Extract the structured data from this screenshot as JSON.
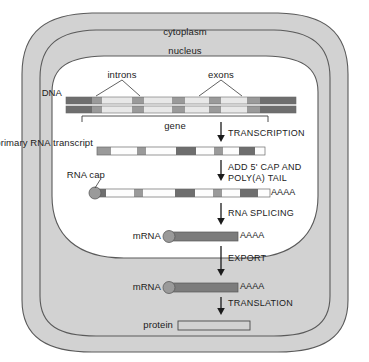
{
  "figure": {
    "compartments": {
      "cytoplasm_label": "cytoplasm",
      "nucleus_label": "nucleus"
    },
    "colors": {
      "cytoplasm_fill": "#d2d2d2",
      "nucleus_fill": "#ffffff",
      "outline": "#5a5a5a",
      "segment_dark": "#6e6e6e",
      "segment_mid": "#9a9a9a",
      "segment_light": "#e8e8e8",
      "segment_white": "#fdfdfd",
      "mrna_body": "#7c7c7c",
      "cap_fill": "#9a9a9a",
      "protein_fill": "#d2d2d2",
      "text": "#1b1b1b"
    },
    "labels": {
      "dna": "DNA",
      "introns": "introns",
      "exons": "exons",
      "gene": "gene",
      "primary_transcript": "primary RNA transcript",
      "rna_cap": "RNA cap",
      "mrna_nucleus": "mRNA",
      "mrna_cytoplasm": "mRNA",
      "protein": "protein",
      "polya_tail_capped": "AAAA",
      "polya_tail_mrna_nucleus": "AAAA",
      "polya_tail_mrna_cytoplasm": "AAAA"
    },
    "steps": [
      {
        "id": "transcription",
        "label": "TRANSCRIPTION",
        "lines": [
          "TRANSCRIPTION"
        ]
      },
      {
        "id": "capping",
        "label": "ADD 5' CAP AND POLY(A) TAIL",
        "lines": [
          "ADD 5' CAP AND",
          "POLY(A) TAIL"
        ]
      },
      {
        "id": "splicing",
        "label": "RNA SPLICING",
        "lines": [
          "RNA SPLICING"
        ]
      },
      {
        "id": "export",
        "label": "EXPORT",
        "lines": [
          "EXPORT"
        ]
      },
      {
        "id": "translation",
        "label": "TRANSLATION",
        "lines": [
          "TRANSLATION"
        ]
      }
    ],
    "molecules": {
      "dna": {
        "name": "DNA double strand",
        "x": 66,
        "width": 230,
        "strand_top_y": 97,
        "strand_bottom_y": 105,
        "strand_height": 7,
        "segments": [
          {
            "w": 26,
            "tone": "dark"
          },
          {
            "w": 10,
            "tone": "mid"
          },
          {
            "w": 30,
            "tone": "light"
          },
          {
            "w": 12,
            "tone": "mid"
          },
          {
            "w": 28,
            "tone": "light"
          },
          {
            "w": 13,
            "tone": "mid"
          },
          {
            "w": 24,
            "tone": "light"
          },
          {
            "w": 12,
            "tone": "mid"
          },
          {
            "w": 26,
            "tone": "light"
          },
          {
            "w": 13,
            "tone": "mid"
          },
          {
            "w": 36,
            "tone": "dark"
          }
        ]
      },
      "primary_transcript": {
        "name": "primary RNA transcript",
        "x": 97,
        "y": 147,
        "width": 168,
        "height": 8,
        "segments": [
          {
            "w": 14,
            "tone": "mid"
          },
          {
            "w": 26,
            "tone": "white"
          },
          {
            "w": 9,
            "tone": "mid"
          },
          {
            "w": 30,
            "tone": "white"
          },
          {
            "w": 20,
            "tone": "dark"
          },
          {
            "w": 18,
            "tone": "white"
          },
          {
            "w": 9,
            "tone": "mid"
          },
          {
            "w": 16,
            "tone": "white"
          },
          {
            "w": 16,
            "tone": "dark"
          },
          {
            "w": 10,
            "tone": "white"
          }
        ]
      },
      "capped_transcript": {
        "name": "capped and polyadenylated transcript",
        "x": 92,
        "y": 189,
        "width": 178,
        "height": 8,
        "cap_cx": 95,
        "cap_cy": 193,
        "cap_r": 6,
        "segments": [
          {
            "w": 14,
            "tone": "dark"
          },
          {
            "w": 28,
            "tone": "white"
          },
          {
            "w": 9,
            "tone": "mid"
          },
          {
            "w": 32,
            "tone": "white"
          },
          {
            "w": 20,
            "tone": "dark"
          },
          {
            "w": 18,
            "tone": "white"
          },
          {
            "w": 9,
            "tone": "mid"
          },
          {
            "w": 18,
            "tone": "white"
          },
          {
            "w": 18,
            "tone": "dark"
          },
          {
            "w": 12,
            "tone": "white"
          }
        ]
      },
      "mrna_nucleus": {
        "name": "mature mRNA in nucleus",
        "x": 166,
        "y": 232,
        "width": 72,
        "height": 9,
        "cap_cx": 169,
        "cap_cy": 236,
        "cap_r": 6
      },
      "mrna_cytoplasm": {
        "name": "mature mRNA in cytoplasm",
        "x": 166,
        "y": 283,
        "width": 72,
        "height": 9,
        "cap_cx": 169,
        "cap_cy": 287,
        "cap_r": 6
      },
      "protein": {
        "name": "protein product",
        "x": 178,
        "y": 321,
        "width": 72,
        "height": 9
      }
    },
    "annotations": {
      "intron_pointers": [
        93,
        143
      ],
      "intron_label_x": 122,
      "exon_pointers": [
        197,
        243
      ],
      "exon_label_x": 221,
      "gene_bracket": {
        "x1": 82,
        "x2": 268,
        "y": 116,
        "tick": 6
      }
    }
  }
}
